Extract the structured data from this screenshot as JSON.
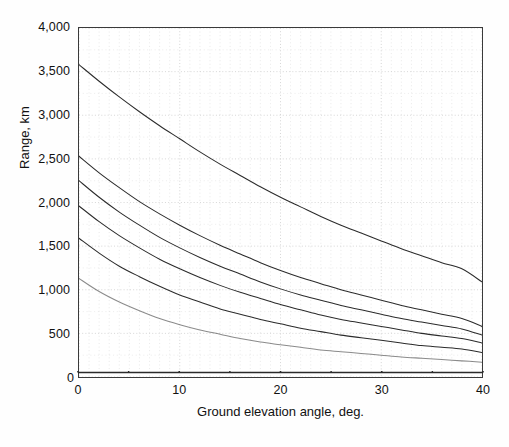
{
  "figure": {
    "background": "#ffffff",
    "frame_color": "#3a3a3a",
    "grid_color": "#cfcfcf",
    "curve_color": "#2b2b2b"
  },
  "axes": {
    "x": {
      "title": "Ground elevation angle, deg.",
      "min": 0,
      "max": 40,
      "major_ticks": [
        0,
        10,
        20,
        30,
        40
      ],
      "major_tick_labels": [
        "0",
        "10",
        "20",
        "30",
        "40"
      ],
      "minor_ticks": [
        5,
        15,
        25,
        35
      ],
      "grid_step": 1
    },
    "y": {
      "title": "Range, km",
      "min": 0,
      "max": 4000,
      "major_ticks": [
        0,
        500,
        1000,
        1500,
        2000,
        2500,
        3000,
        3500,
        4000
      ],
      "major_tick_labels": [
        "0",
        "500",
        "1,000",
        "1,500",
        "2,000",
        "2,500",
        "3,000",
        "3,500",
        "4,000"
      ],
      "grid_step": 250
    }
  },
  "chart_data": {
    "type": "line",
    "title": "",
    "subtitle": "",
    "xlabel": "Ground elevation angle, deg.",
    "ylabel": "Range, km",
    "xlim": [
      0,
      40
    ],
    "ylim": [
      0,
      4000
    ],
    "grid": true,
    "legend": "none",
    "x": [
      0,
      2,
      4,
      6,
      8,
      10,
      12,
      14,
      16,
      18,
      20,
      22,
      24,
      26,
      28,
      30,
      32,
      34,
      36,
      38,
      40
    ],
    "series": [
      {
        "name": "curve-1",
        "values": [
          3580,
          3390,
          3210,
          3040,
          2880,
          2730,
          2580,
          2440,
          2310,
          2180,
          2060,
          1950,
          1840,
          1740,
          1650,
          1560,
          1470,
          1390,
          1310,
          1240,
          1090
        ]
      },
      {
        "name": "curve-2",
        "values": [
          2530,
          2340,
          2170,
          2010,
          1870,
          1740,
          1620,
          1510,
          1410,
          1310,
          1220,
          1140,
          1070,
          1000,
          940,
          880,
          820,
          770,
          720,
          670,
          580
        ]
      },
      {
        "name": "curve-3",
        "values": [
          2250,
          2060,
          1890,
          1740,
          1600,
          1480,
          1370,
          1270,
          1180,
          1090,
          1010,
          940,
          880,
          820,
          770,
          720,
          670,
          630,
          590,
          550,
          480
        ]
      },
      {
        "name": "curve-4",
        "values": [
          1960,
          1780,
          1620,
          1480,
          1350,
          1240,
          1140,
          1050,
          970,
          900,
          830,
          770,
          710,
          660,
          620,
          580,
          540,
          500,
          470,
          440,
          390
        ]
      },
      {
        "name": "curve-5",
        "values": [
          1590,
          1420,
          1270,
          1150,
          1040,
          940,
          860,
          780,
          720,
          660,
          610,
          560,
          520,
          480,
          450,
          420,
          390,
          360,
          340,
          320,
          280
        ]
      },
      {
        "name": "curve-6",
        "values": [
          1130,
          980,
          860,
          760,
          670,
          600,
          540,
          490,
          440,
          400,
          370,
          340,
          310,
          290,
          270,
          250,
          230,
          215,
          200,
          185,
          170
        ]
      }
    ]
  }
}
